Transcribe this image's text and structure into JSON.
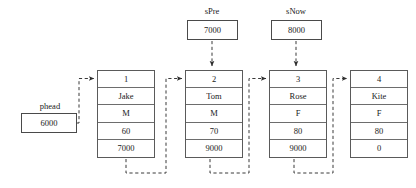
{
  "diagram": {
    "colors": {
      "background": "#ffffff",
      "box_border": "#5a5a5a",
      "cell_divider": "#6d6d6d",
      "connector": "#3a3a3a",
      "text": "#1a1a1a"
    },
    "pointers": [
      {
        "name": "phead",
        "label": "phead",
        "value": "6000"
      },
      {
        "name": "sPre",
        "label": "sPre",
        "value": "7000"
      },
      {
        "name": "sNow",
        "label": "sNow",
        "value": "8000"
      }
    ],
    "node_fields": [
      "id",
      "name",
      "gender",
      "score",
      "next"
    ],
    "nodes": [
      {
        "id": "1",
        "name": "Jake",
        "gender": "M",
        "score": "60",
        "next": "7000"
      },
      {
        "id": "2",
        "name": "Tom",
        "gender": "M",
        "score": "70",
        "next": "9000"
      },
      {
        "id": "3",
        "name": "Rose",
        "gender": "F",
        "score": "80",
        "next": "9000"
      },
      {
        "id": "4",
        "name": "Kite",
        "gender": "F",
        "score": "80",
        "next": "0"
      }
    ]
  }
}
